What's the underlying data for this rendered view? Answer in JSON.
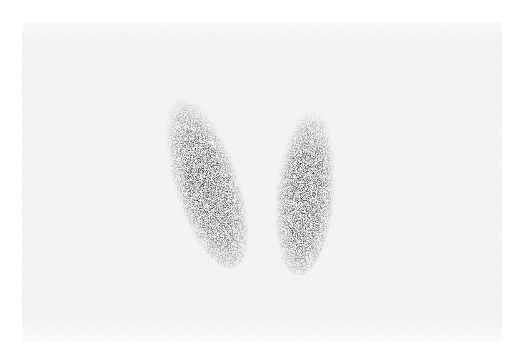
{
  "image": {
    "subject": "thyroid scintigraphy",
    "background_color": "#f4f4f4",
    "uptake_color": "#1a1a1a",
    "lobes": [
      {
        "name": "right-lobe",
        "cx": 205,
        "cy": 178,
        "rx": 30,
        "ry": 92,
        "rotate": -18
      },
      {
        "name": "left-lobe",
        "cx": 306,
        "cy": 188,
        "rx": 27,
        "ry": 85,
        "rotate": 5
      }
    ]
  }
}
